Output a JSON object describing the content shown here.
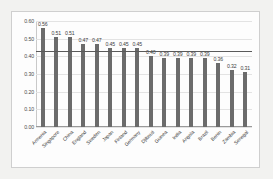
{
  "chart_data": {
    "type": "bar",
    "title": "",
    "subtitle": "",
    "xlabel": "",
    "ylabel": "",
    "ylim": [
      0.0,
      0.6
    ],
    "grid": true,
    "legend": "none",
    "yticks": [
      "0.60",
      "0.50",
      "0.40",
      "0.30",
      "0.20",
      "0.10",
      "0.00"
    ],
    "ytick_values": [
      0.6,
      0.5,
      0.4,
      0.3,
      0.2,
      0.1,
      0.0
    ],
    "categories": [
      "Armenia",
      "Singapore",
      "China",
      "England",
      "Sweden",
      "Japan",
      "Finland",
      "Germany",
      "Djibouti",
      "Guinea",
      "India",
      "Angola",
      "Brazil",
      "Benin",
      "Zambia",
      "Senegal"
    ],
    "values": [
      0.56,
      0.51,
      0.51,
      0.47,
      0.47,
      0.45,
      0.45,
      0.45,
      0.4,
      0.39,
      0.39,
      0.39,
      0.39,
      0.36,
      0.32,
      0.31
    ],
    "data_labels": [
      "0.56",
      "0.51",
      "0.51",
      "0.47",
      "0.47",
      "0.45",
      "0.45",
      "0.45",
      "0.40",
      "0.39",
      "0.39",
      "0.39",
      "0.39",
      "0.36",
      "0.32",
      "0.31"
    ],
    "reference_line": {
      "value": 0.43,
      "label": "",
      "color": "#5a5a5a"
    },
    "colors": {
      "bar": "#6b6b6b",
      "panel_background": "#fdfdfd",
      "figure_background": "#f2f2f0",
      "gridline": "#e3e3e3",
      "axis": "#9a9a9a",
      "text": "#3d3d3d"
    }
  }
}
